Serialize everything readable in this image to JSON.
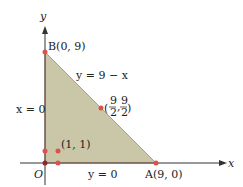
{
  "axes": {
    "x_label": "x",
    "y_label": "y",
    "origin_label": "O"
  },
  "region": {
    "fill_color": "#c9c7a8",
    "edge_color": "#d98a7a"
  },
  "points": {
    "B": "B(0, 9)",
    "A": "A(9, 0)",
    "mid_num": "9",
    "mid_den": "2",
    "p11": "(1, 1)"
  },
  "lines": {
    "hyp": "y = 9 − x",
    "left": "x = 0",
    "bottom": "y = 0"
  },
  "colors": {
    "point": "#d9534f",
    "axis": "#333333"
  }
}
